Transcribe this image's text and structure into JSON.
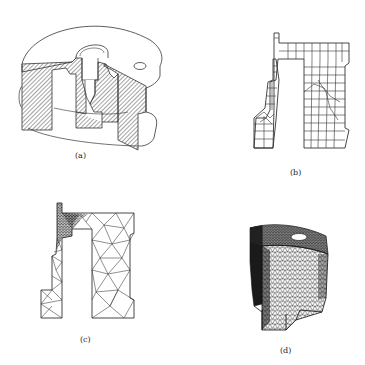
{
  "figure": {
    "panels": [
      {
        "id": "a",
        "label": "(a)",
        "description": "Cut-away CAD model of cylindrical part with hatched cross-section"
      },
      {
        "id": "b",
        "label": "(b)",
        "description": "2D quadrilateral mesh of cross-section"
      },
      {
        "id": "c",
        "label": "(c)",
        "description": "2D triangular mesh of cross-section with refinement at fillet"
      },
      {
        "id": "d",
        "label": "(d)",
        "description": "3D tetrahedral surface mesh of part sector"
      }
    ]
  },
  "colors": {
    "line": "#333333",
    "background": "#ffffff",
    "dense_mesh": "#1a1a1a"
  }
}
